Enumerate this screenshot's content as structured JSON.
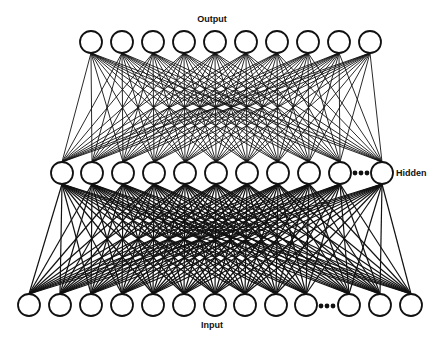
{
  "labels": {
    "output": "Output",
    "hidden": "Hidden",
    "input": "Input"
  },
  "style": {
    "line_color": "#111111",
    "node_fill": "#ffffff",
    "background": "#ffffff"
  },
  "node_radius": 11,
  "layers": {
    "output": {
      "y": 42,
      "x": [
        91,
        122,
        153,
        184,
        215,
        246,
        277,
        308,
        339,
        370
      ],
      "ellipsis": null
    },
    "hidden": {
      "y": 173,
      "x": [
        62,
        92,
        123,
        154,
        185,
        216,
        247,
        278,
        309,
        340,
        382
      ],
      "ellipsis": {
        "x": 361,
        "y": 173
      }
    },
    "input": {
      "y": 305,
      "x": [
        29,
        60,
        91,
        122,
        153,
        184,
        215,
        245,
        276,
        306,
        349,
        380,
        411
      ],
      "ellipsis": {
        "x": 327,
        "y": 306
      }
    }
  },
  "label_positions": {
    "output": {
      "x": 212,
      "y": 22
    },
    "hidden": {
      "x": 396,
      "y": 176
    },
    "input": {
      "x": 212,
      "y": 328
    }
  }
}
